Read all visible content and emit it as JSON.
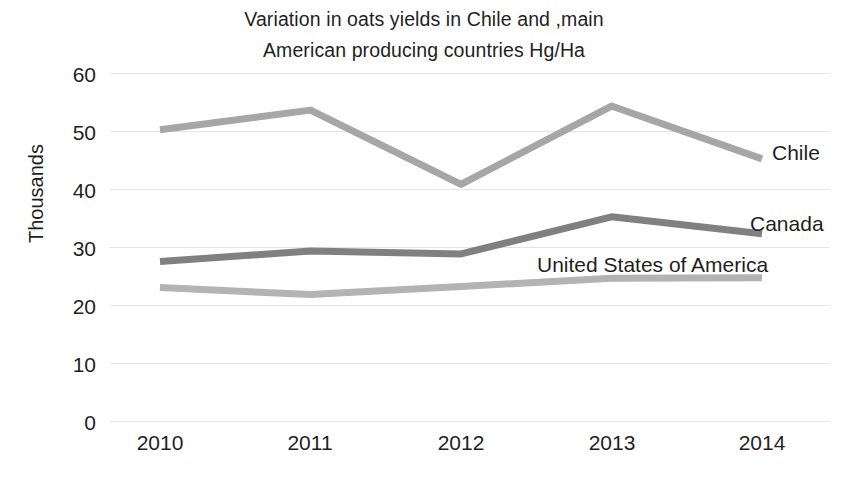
{
  "chart_data": {
    "type": "line",
    "title": "Variation in oats yields in Chile and ,main American producing countries Hg/Ha",
    "title_lines": [
      "Variation in oats yields in Chile and ,main",
      "American producing countries Hg/Ha"
    ],
    "xlabel": "",
    "ylabel": "Thousands",
    "categories": [
      "2010",
      "2011",
      "2012",
      "2013",
      "2014"
    ],
    "x": [
      2010,
      2011,
      2012,
      2013,
      2014
    ],
    "ylim": [
      0,
      60
    ],
    "ytick_labels": [
      "60",
      "50",
      "40",
      "30",
      "20",
      "10",
      "0"
    ],
    "yticks": [
      60,
      50,
      40,
      30,
      20,
      10,
      0
    ],
    "grid": "horizontal",
    "legend_position": "inline-right-labels",
    "series": [
      {
        "name": "Chile",
        "color": "#a6a6a6",
        "values": [
          50.2,
          53.6,
          40.8,
          54.3,
          45.2
        ]
      },
      {
        "name": "Canada",
        "color": "#808080",
        "values": [
          27.5,
          29.3,
          28.8,
          35.2,
          32.3
        ]
      },
      {
        "name": "United States of America",
        "color": "#b3b3b3",
        "values": [
          23.0,
          21.8,
          23.2,
          24.6,
          24.7
        ]
      }
    ]
  },
  "labels": {
    "chile": "Chile",
    "canada": "Canada",
    "usa": "United States of America"
  },
  "colors": {
    "background": "#ffffff",
    "text": "#1f1f1f",
    "gridline": "#e3e3e8",
    "chile": "#a6a6a6",
    "canada": "#808080",
    "usa": "#b3b3b3"
  }
}
